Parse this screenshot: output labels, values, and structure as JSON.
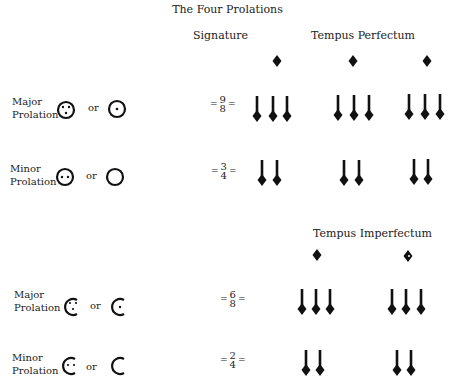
{
  "title": "The Four Prolations",
  "headers": {
    "signature": "Signature",
    "tempus_perfectum": "Tempus Perfectum",
    "tempus_imperfectum": "Tempus Imperfectum"
  },
  "connector": "or",
  "rows": [
    {
      "label_line1": "Major",
      "label_line2": "Prolation",
      "symbol": "circle-three-dots",
      "alt_symbol": "circle-one-dot",
      "numerator": "9",
      "denominator": "8",
      "eq": "="
    },
    {
      "label_line1": "Minor",
      "label_line2": "Prolation",
      "symbol": "circle-two-dots",
      "alt_symbol": "circle-empty",
      "numerator": "3",
      "denominator": "4",
      "eq": "="
    },
    {
      "label_line1": "Major",
      "label_line2": "Prolation",
      "symbol": "half-circle-three-dots",
      "alt_symbol": "half-circle-one-dot",
      "numerator": "6",
      "denominator": "8",
      "eq": "="
    },
    {
      "label_line1": "Minor",
      "label_line2": "Prolation",
      "symbol": "half-circle-two-dots",
      "alt_symbol": "half-circle-empty",
      "numerator": "2",
      "denominator": "4",
      "eq": "="
    }
  ],
  "notation": {
    "perfectum_breves": 3,
    "imperfectum_breves": 2,
    "major_notes_per_group": 3,
    "minor_notes_per_group": 2
  }
}
